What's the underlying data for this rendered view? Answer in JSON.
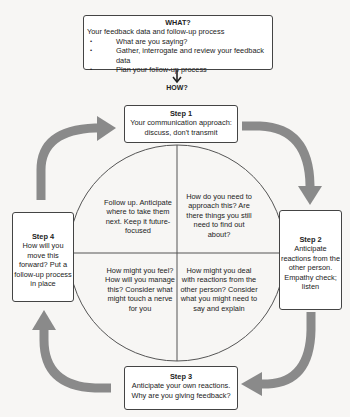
{
  "colors": {
    "background": "#f7f6f4",
    "box_border": "#444444",
    "arrow_gray": "#8a8a8a",
    "circle_line": "#555555"
  },
  "what": {
    "title": "WHAT?",
    "intro": "Your feedback data and follow-up process",
    "bullets": [
      "What are you saying?",
      "Gather, interrogate and review your feedback data",
      "Plan your follow-up process"
    ]
  },
  "how": {
    "label": "HOW?"
  },
  "steps": [
    {
      "title": "Step 1",
      "text": "Your communication approach: discuss, don't transmit"
    },
    {
      "title": "Step 2",
      "text": "Anticipate reactions from the other person. Empathy check; listen"
    },
    {
      "title": "Step 3",
      "text": "Anticipate your own reactions. Why are you giving feedback?"
    },
    {
      "title": "Step 4",
      "text": "How will you move this forward? Put a follow-up process in place"
    }
  ],
  "circle": {
    "quadrants": {
      "top_left": "Follow up. Anticipate where to take them next. Keep it future-focused",
      "top_right": "How do you need to approach this? Are there things you still need to find out about?",
      "bottom_left": "How might you feel? How will you manage this? Consider what might touch a nerve for you",
      "bottom_right": "How might you deal with reactions from the other person? Consider what you might need to say and explain"
    }
  },
  "icons": {
    "down_arrow": "arrow-down-icon",
    "cycle_arrows": [
      "curved-arrow-step4-to-step1",
      "curved-arrow-step1-to-step2",
      "curved-arrow-step2-to-step3",
      "curved-arrow-step3-to-step4"
    ]
  }
}
